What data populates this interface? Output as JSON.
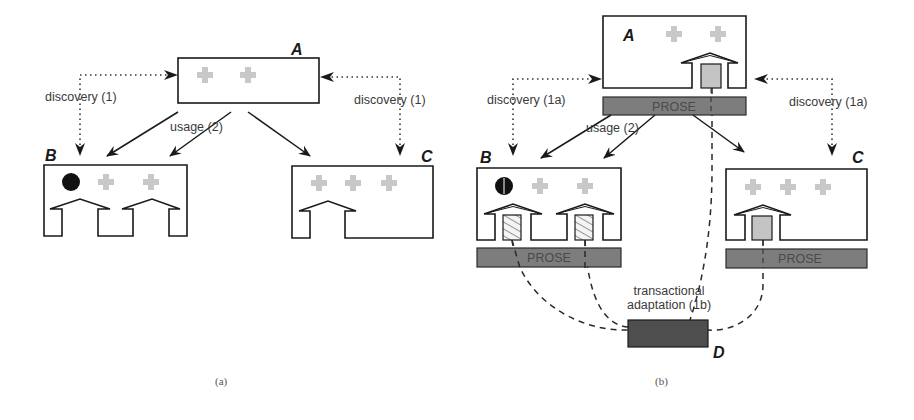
{
  "figure": {
    "panel_a": {
      "caption": "(a)",
      "nodes": {
        "A": "A",
        "B": "B",
        "C": "C"
      },
      "labels": {
        "discovery_left": "discovery (1)",
        "discovery_right": "discovery (1)",
        "usage": "usage (2)"
      }
    },
    "panel_b": {
      "caption": "(b)",
      "nodes": {
        "A": "A",
        "B": "B",
        "C": "C",
        "D": "D"
      },
      "labels": {
        "discovery_left": "discovery (1a)",
        "discovery_right": "discovery (1a)",
        "usage": "usage (2)",
        "transactional_line1": "transactional",
        "transactional_line2": "adaptation (1b)",
        "prose_a": "PROSE",
        "prose_b": "PROSE",
        "prose_c": "PROSE"
      }
    }
  },
  "colors": {
    "prose_bar": "#7d7d7d",
    "d_box": "#4e4e4e",
    "cross_gray": "#c8c8c8",
    "plug_gray": "#c4c4c4"
  }
}
